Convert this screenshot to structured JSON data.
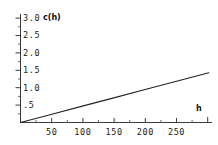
{
  "chart_data": {
    "type": "line",
    "title": "",
    "subtitle": "",
    "xlabel": "h",
    "ylabel": "c(h)",
    "grid": false,
    "legend": null,
    "xlim": [
      0,
      305
    ],
    "ylim": [
      0,
      3.0
    ],
    "x_ticks": [
      50,
      100,
      150,
      200,
      250
    ],
    "x_tick_labels": [
      "50",
      "100",
      "150",
      "200",
      "250"
    ],
    "x_minor_ticks": [
      25,
      75,
      125,
      175,
      225,
      275
    ],
    "y_ticks": [
      0.5,
      1.0,
      1.5,
      2.0,
      2.5,
      3.0
    ],
    "y_tick_labels": [
      ".5",
      "1.0",
      "1.5",
      "2.0",
      "2.5",
      "3.0"
    ],
    "series": [
      {
        "name": "c(h)",
        "type": "line",
        "color": "#222222",
        "x": [
          0,
          50,
          100,
          150,
          200,
          250,
          300
        ],
        "y": [
          0.0,
          0.238,
          0.477,
          0.715,
          0.953,
          1.192,
          1.43
        ]
      }
    ],
    "annotations": []
  },
  "axis_titles": {
    "y": "c(h)",
    "x": "h"
  },
  "y_labels": {
    "t0": ".5",
    "t1": "1.0",
    "t2": "1.5",
    "t3": "2.0",
    "t4": "2.5",
    "t5": "3.0"
  },
  "x_labels": {
    "t0": "50",
    "t1": "100",
    "t2": "150",
    "t3": "200",
    "t4": "250"
  },
  "colors": {
    "line": "#222222",
    "axis": "#3a3a3a",
    "text": "#1a1a1a",
    "background": "#ffffff"
  }
}
